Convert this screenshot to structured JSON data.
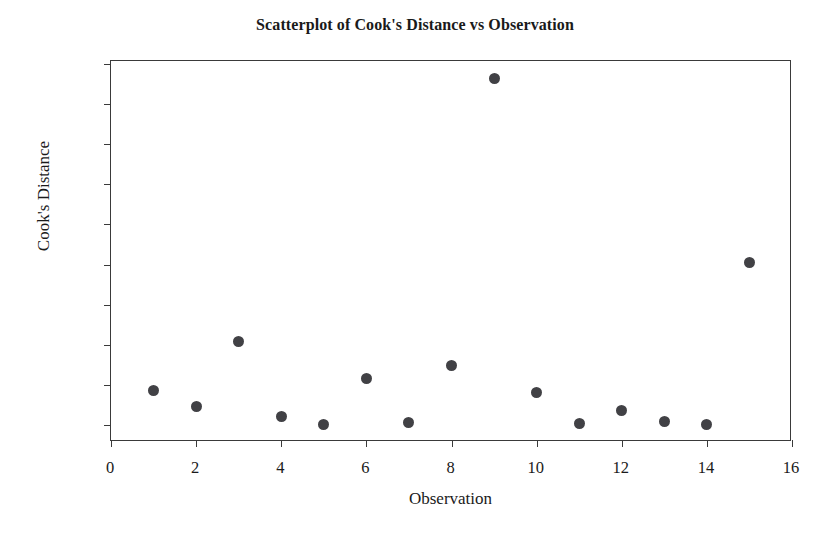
{
  "chart_data": {
    "type": "scatter",
    "title": "Scatterplot of Cook's Distance vs Observation",
    "xlabel": "Observation",
    "ylabel": "Cook's Distance",
    "xlim": [
      0,
      16
    ],
    "ylim": [
      0.0,
      0.9
    ],
    "grid": false,
    "legend": null,
    "xticks": [
      0,
      2,
      4,
      6,
      8,
      10,
      12,
      14,
      16
    ],
    "xtick_labels": [
      "0",
      "2",
      "4",
      "6",
      "8",
      "10",
      "12",
      "14",
      "16"
    ],
    "yticks": [
      0.0,
      0.1,
      0.2,
      0.3,
      0.4,
      0.5,
      0.6,
      0.7,
      0.8,
      0.9
    ],
    "ytick_labels": [
      "0.0",
      "0.1",
      "0.2",
      "0.3",
      "0.4",
      "0.5",
      "0.6",
      "0.7",
      "0.8",
      "0.9"
    ],
    "marker": "filled-circle",
    "marker_color": "#414145",
    "marker_size": 11,
    "x": [
      1,
      2,
      3,
      4,
      5,
      6,
      7,
      8,
      9,
      10,
      11,
      12,
      13,
      14,
      15
    ],
    "y": [
      0.086,
      0.045,
      0.207,
      0.02,
      0.001,
      0.117,
      0.006,
      0.149,
      0.864,
      0.08,
      0.003,
      0.035,
      0.008,
      0.002,
      0.406
    ],
    "points": [
      {
        "label": "observation-1",
        "x": 1,
        "y": 0.086
      },
      {
        "label": "observation-2",
        "x": 2,
        "y": 0.045
      },
      {
        "label": "observation-3",
        "x": 3,
        "y": 0.207
      },
      {
        "label": "observation-4",
        "x": 4,
        "y": 0.02
      },
      {
        "label": "observation-5",
        "x": 5,
        "y": 0.001
      },
      {
        "label": "observation-6",
        "x": 6,
        "y": 0.117
      },
      {
        "label": "observation-7",
        "x": 7,
        "y": 0.006
      },
      {
        "label": "observation-8",
        "x": 8,
        "y": 0.149
      },
      {
        "label": "observation-9",
        "x": 9,
        "y": 0.864
      },
      {
        "label": "observation-10",
        "x": 10,
        "y": 0.08
      },
      {
        "label": "observation-11",
        "x": 11,
        "y": 0.003
      },
      {
        "label": "observation-12",
        "x": 12,
        "y": 0.035
      },
      {
        "label": "observation-13",
        "x": 13,
        "y": 0.008
      },
      {
        "label": "observation-14",
        "x": 14,
        "y": 0.002
      },
      {
        "label": "observation-15",
        "x": 15,
        "y": 0.406
      }
    ]
  },
  "colors": {
    "background": "#ffffff",
    "axis": "#3a3a3a",
    "text": "#1a1a1a",
    "marker": "#414145"
  }
}
